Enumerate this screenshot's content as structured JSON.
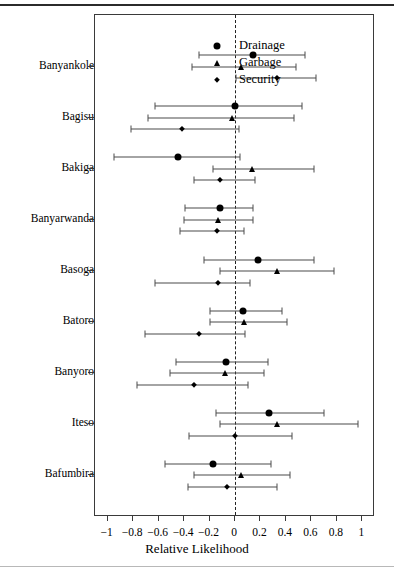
{
  "chart_data": {
    "type": "scatter",
    "title": "",
    "xlabel": "Relative Likelihood",
    "ylabel": "",
    "xlim": [
      -1.1,
      1.1
    ],
    "grid": false,
    "reference_line": 0,
    "legend_position": "top-left",
    "xticks": [
      -1,
      -0.8,
      -0.6,
      -0.4,
      -0.2,
      0,
      0.2,
      0.4,
      0.6,
      0.8,
      1
    ],
    "xtick_labels": [
      "−1",
      "−0.8",
      "−0.6",
      "−0.4",
      "−0.2",
      "0",
      "0.2",
      "0.4",
      "0.6",
      "0.8",
      "1"
    ],
    "categories": [
      "Banyankole",
      "Bagisu",
      "Bakiga",
      "Banyarwanda",
      "Basoga",
      "Batoro",
      "Banyoro",
      "Iteso",
      "Bafumbira"
    ],
    "series": [
      {
        "name": "Drainage",
        "marker": "circle",
        "values": [
          0.14,
          0.0,
          -0.45,
          -0.12,
          0.18,
          0.06,
          -0.07,
          0.27,
          -0.17
        ],
        "ci_low": [
          -0.28,
          -0.63,
          -0.95,
          -0.39,
          -0.24,
          -0.2,
          -0.46,
          -0.15,
          -0.55
        ],
        "ci_high": [
          0.55,
          0.53,
          0.04,
          0.14,
          0.62,
          0.37,
          0.26,
          0.7,
          0.28
        ]
      },
      {
        "name": "Garbage",
        "marker": "triangle",
        "values": [
          0.05,
          -0.02,
          0.13,
          -0.13,
          0.33,
          0.07,
          -0.08,
          0.33,
          0.05
        ],
        "ci_low": [
          -0.34,
          -0.68,
          -0.17,
          -0.4,
          -0.12,
          -0.2,
          -0.51,
          -0.12,
          -0.32
        ],
        "ci_high": [
          0.48,
          0.46,
          0.62,
          0.14,
          0.78,
          0.41,
          0.23,
          0.97,
          0.43
        ]
      },
      {
        "name": "Security",
        "marker": "diamond",
        "values": [
          0.33,
          -0.42,
          -0.12,
          -0.14,
          -0.13,
          -0.28,
          -0.32,
          0.0,
          -0.06
        ],
        "ci_low": [
          0.01,
          -0.82,
          -0.32,
          -0.43,
          -0.63,
          -0.71,
          -0.77,
          -0.36,
          -0.37
        ],
        "ci_high": [
          0.64,
          0.03,
          0.16,
          0.07,
          0.12,
          0.08,
          0.1,
          0.45,
          0.33
        ]
      }
    ]
  },
  "legend": {
    "items": [
      {
        "label": "Drainage",
        "marker": "circle"
      },
      {
        "label": "Garbage",
        "marker": "triangle"
      },
      {
        "label": "Security",
        "marker": "diamond"
      }
    ]
  },
  "axis": {
    "x_title": "Relative Likelihood"
  }
}
